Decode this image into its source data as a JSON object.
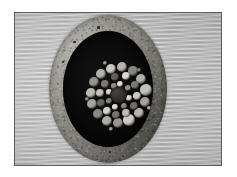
{
  "figure": {
    "caption": "",
    "colors": {
      "page_background": "#ffffff",
      "frame_border": "#5e5e5e",
      "plate_background": "#bdbdbd",
      "jacket_light": "#a6a49d",
      "jacket_dark": "#5f5d57",
      "inner_field": "#070707",
      "core": "#35322c",
      "strand_bright": "#d8d6d0",
      "strand_mid": "#9a978f",
      "strand_dark": "#56534c"
    },
    "geometry": {
      "plate": {
        "x": 14,
        "y": 12,
        "width": 208,
        "height": 154
      },
      "outer_disc": {
        "cx": 93,
        "cy": 88,
        "rx": 59,
        "ry": 74
      },
      "inner_field": {
        "cx": 93,
        "cy": 88,
        "rx": 45,
        "ry": 58
      },
      "core": {
        "cx": 118,
        "cy": 86,
        "r": 8
      }
    }
  },
  "chart_data": {
    "type": "scatter",
    "xlabel": "",
    "ylabel": "",
    "xlim": [
      0,
      122
    ],
    "ylim": [
      0,
      150
    ],
    "grid": false,
    "legend": "none",
    "annotations": [
      "outer jacket annulus",
      "black insulation field",
      "concentric strand rings",
      "dark central core"
    ],
    "series": [
      {
        "name": "strands",
        "note": "cx, cy in specimen-local px; r = radius px; tone = grayscale hex",
        "points": [
          {
            "cx": 62,
            "cy": 54,
            "r": 5.2,
            "tone": "#c9c7c1"
          },
          {
            "cx": 73,
            "cy": 52,
            "r": 5.0,
            "tone": "#b6b3ad"
          },
          {
            "cx": 84,
            "cy": 56,
            "r": 4.6,
            "tone": "#8a877f"
          },
          {
            "cx": 92,
            "cy": 64,
            "r": 5.4,
            "tone": "#b2afa8"
          },
          {
            "cx": 97,
            "cy": 75,
            "r": 5.6,
            "tone": "#c3c0ba"
          },
          {
            "cx": 96,
            "cy": 87,
            "r": 5.2,
            "tone": "#a5a29b"
          },
          {
            "cx": 90,
            "cy": 98,
            "r": 5.4,
            "tone": "#b9b6b0"
          },
          {
            "cx": 80,
            "cy": 105,
            "r": 5.6,
            "tone": "#cecbc5"
          },
          {
            "cx": 69,
            "cy": 108,
            "r": 5.4,
            "tone": "#9b9891"
          },
          {
            "cx": 58,
            "cy": 106,
            "r": 5.0,
            "tone": "#b0ada6"
          },
          {
            "cx": 49,
            "cy": 99,
            "r": 5.2,
            "tone": "#8d8a83"
          },
          {
            "cx": 43,
            "cy": 89,
            "r": 5.0,
            "tone": "#a8a59e"
          },
          {
            "cx": 42,
            "cy": 78,
            "r": 4.8,
            "tone": "#bdbab4"
          },
          {
            "cx": 45,
            "cy": 67,
            "r": 5.0,
            "tone": "#96938c"
          },
          {
            "cx": 52,
            "cy": 59,
            "r": 4.8,
            "tone": "#b4b1aa"
          },
          {
            "cx": 66,
            "cy": 62,
            "r": 4.2,
            "tone": "#63605a"
          },
          {
            "cx": 77,
            "cy": 61,
            "r": 4.0,
            "tone": "#dad8d2"
          },
          {
            "cx": 86,
            "cy": 70,
            "r": 4.0,
            "tone": "#7c7972"
          },
          {
            "cx": 88,
            "cy": 81,
            "r": 3.8,
            "tone": "#cdcac4"
          },
          {
            "cx": 85,
            "cy": 91,
            "r": 4.0,
            "tone": "#6f6c66"
          },
          {
            "cx": 77,
            "cy": 98,
            "r": 4.2,
            "tone": "#c0bdb7"
          },
          {
            "cx": 67,
            "cy": 100,
            "r": 4.0,
            "tone": "#76736c"
          },
          {
            "cx": 58,
            "cy": 96,
            "r": 3.8,
            "tone": "#d2cfc9"
          },
          {
            "cx": 52,
            "cy": 88,
            "r": 4.0,
            "tone": "#6a6761"
          },
          {
            "cx": 51,
            "cy": 78,
            "r": 3.8,
            "tone": "#c6c3bd"
          },
          {
            "cx": 56,
            "cy": 69,
            "r": 3.8,
            "tone": "#7f7c75"
          },
          {
            "cx": 71,
            "cy": 69,
            "r": 3.0,
            "tone": "#e2e0da"
          },
          {
            "cx": 79,
            "cy": 73,
            "r": 2.8,
            "tone": "#918e87"
          },
          {
            "cx": 80,
            "cy": 83,
            "r": 2.8,
            "tone": "#dcd9d3"
          },
          {
            "cx": 75,
            "cy": 91,
            "r": 3.0,
            "tone": "#8b8881"
          },
          {
            "cx": 66,
            "cy": 92,
            "r": 2.8,
            "tone": "#e0ded8"
          },
          {
            "cx": 60,
            "cy": 86,
            "r": 2.8,
            "tone": "#85827b"
          },
          {
            "cx": 60,
            "cy": 77,
            "r": 2.6,
            "tone": "#d7d4ce"
          },
          {
            "cx": 65,
            "cy": 71,
            "r": 2.6,
            "tone": "#8f8c85"
          },
          {
            "cx": 56,
            "cy": 48,
            "r": 2.2,
            "tone": "#9e9b94"
          },
          {
            "cx": 90,
            "cy": 55,
            "r": 2.4,
            "tone": "#8a877f"
          },
          {
            "cx": 100,
            "cy": 93,
            "r": 2.4,
            "tone": "#b5b2ab"
          },
          {
            "cx": 62,
            "cy": 114,
            "r": 2.4,
            "tone": "#a09d96"
          },
          {
            "cx": 38,
            "cy": 84,
            "r": 2.2,
            "tone": "#949189"
          }
        ]
      }
    ]
  }
}
